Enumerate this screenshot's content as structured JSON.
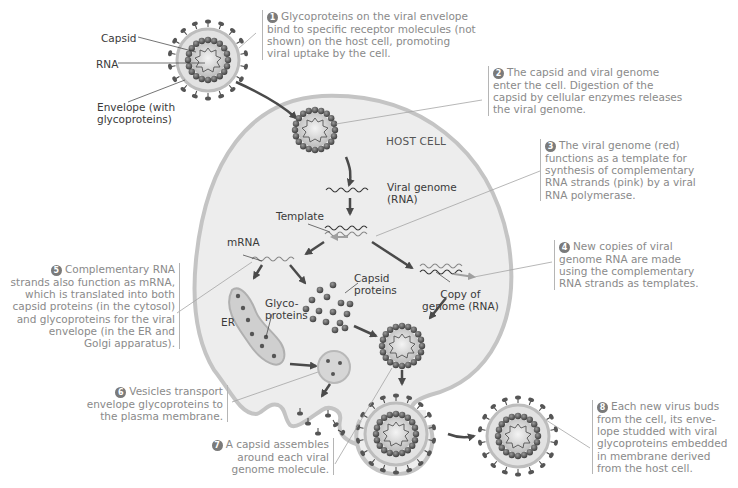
{
  "diagram": {
    "colors": {
      "cell_fill": "#ededed",
      "cell_membrane": "#c4c4c4",
      "capsomere": "#5a5a5a",
      "arrow": "#4a4a4a",
      "step_text": "#8a8a8a",
      "label_text": "#3a3a3a"
    },
    "virus_labels": {
      "capsid": "Capsid",
      "rna": "RNA",
      "envelope_line1": "Envelope (with",
      "envelope_line2": "glycoproteins)"
    },
    "host_cell_label": "HOST CELL",
    "inner_labels": {
      "viral_genome_line1": "Viral genome",
      "viral_genome_line2": "(RNA)",
      "template": "Template",
      "mrna": "mRNA",
      "capsid_proteins_line1": "Capsid",
      "capsid_proteins_line2": "proteins",
      "copy_line1": "Copy of",
      "copy_line2": "genome (RNA)",
      "er": "ER",
      "glyco_line1": "Glyco-",
      "glyco_line2": "proteins"
    },
    "steps": [
      {
        "num": "1",
        "lines": [
          "Glycoproteins on the viral envelope",
          "bind to specific receptor molecules (not",
          "shown) on the host cell, promoting",
          "viral uptake by the cell."
        ]
      },
      {
        "num": "2",
        "lines": [
          "The capsid and viral genome",
          "enter the cell. Digestion of the",
          "capsid by cellular enzymes releases",
          "the viral genome."
        ]
      },
      {
        "num": "3",
        "lines": [
          "The viral genome (red)",
          "functions as a template for",
          "synthesis of complementary",
          "RNA strands (pink) by a viral",
          "RNA polymerase."
        ]
      },
      {
        "num": "4",
        "lines": [
          "New copies of viral",
          "genome RNA are made",
          "using the complementary",
          "RNA strands as templates."
        ]
      },
      {
        "num": "5",
        "lines": [
          "Complementary RNA",
          "strands also function as mRNA,",
          "which is translated into both",
          "capsid proteins (in the cytosol)",
          "and glycoproteins for the viral",
          "envelope (in the ER and",
          "Golgi apparatus)."
        ]
      },
      {
        "num": "6",
        "lines": [
          "Vesicles transport",
          "envelope glycoproteins to",
          "the plasma membrane."
        ]
      },
      {
        "num": "7",
        "lines": [
          "A capsid assembles",
          "around each viral",
          "genome molecule."
        ]
      },
      {
        "num": "8",
        "lines": [
          "Each new virus buds",
          "from the cell, its enve-",
          "lope studded with viral",
          "glycoproteins embedded",
          "in membrane derived",
          "from the host cell."
        ]
      }
    ]
  }
}
